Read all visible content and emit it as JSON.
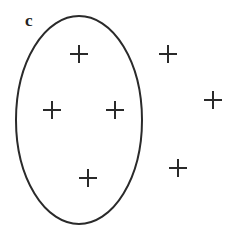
{
  "figure": {
    "panel_label": "c",
    "stroke_color": "#2a2a2a",
    "background": "#ffffff",
    "ellipse": {
      "cx": 79,
      "cy": 120,
      "rx": 63,
      "ry": 104
    },
    "crosses_inside": [
      {
        "x": 79,
        "y": 54
      },
      {
        "x": 52,
        "y": 110
      },
      {
        "x": 115,
        "y": 110
      },
      {
        "x": 88,
        "y": 178
      }
    ],
    "crosses_outside": [
      {
        "x": 168,
        "y": 54
      },
      {
        "x": 213,
        "y": 100
      },
      {
        "x": 178,
        "y": 168
      }
    ],
    "cross_half_size": 9
  }
}
